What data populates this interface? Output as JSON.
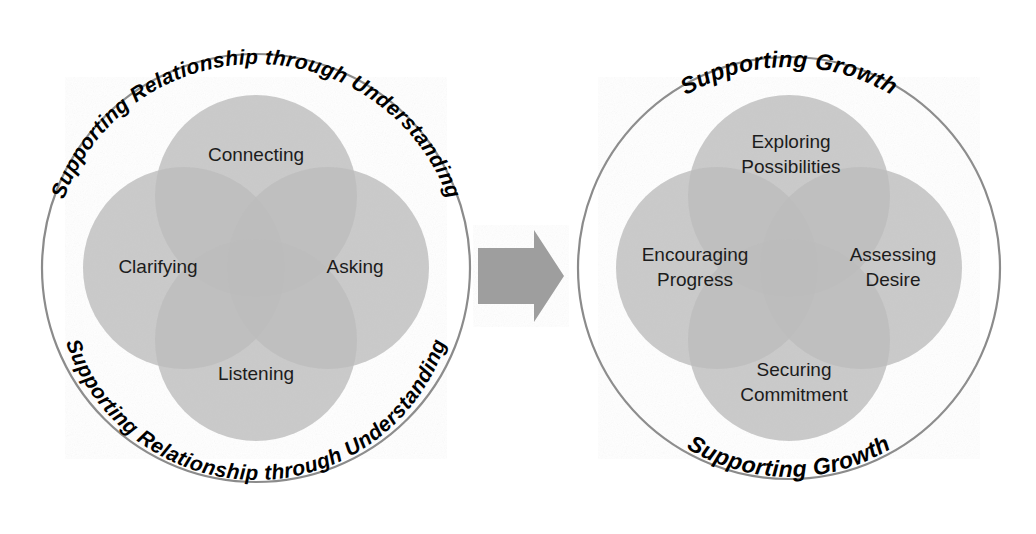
{
  "figure": {
    "background_color": "#ffffff",
    "outline_color": "#7a7a7a",
    "petal_fill": "#c3c3c3",
    "petal_overlap_fill": "#b0b0b0",
    "arrow_fill": "#9e9e9e",
    "label_color": "#1c1c1c",
    "arc_label_color": "#000000"
  },
  "left_circle": {
    "name": "supporting-relationship-circle",
    "arc_top_label": "Supporting Relationship through Understanding",
    "arc_bottom_label": "Supporting Relationship through Understanding",
    "center": {
      "x": 256,
      "y": 268
    },
    "radius": 214,
    "petals": [
      {
        "position": "top",
        "label": "Connecting",
        "lines": [
          "Connecting"
        ],
        "cx": 256,
        "cy": 196,
        "r": 101
      },
      {
        "position": "left",
        "label": "Clarifying",
        "lines": [
          "Clarifying"
        ],
        "cx": 184,
        "cy": 268,
        "r": 101
      },
      {
        "position": "right",
        "label": "Asking",
        "lines": [
          "Asking"
        ],
        "cx": 328,
        "cy": 268,
        "r": 101
      },
      {
        "position": "bottom",
        "label": "Listening",
        "lines": [
          "Listening"
        ],
        "cx": 256,
        "cy": 340,
        "r": 101
      }
    ],
    "label_positions": [
      {
        "x": 256,
        "y": 156
      },
      {
        "x": 158,
        "y": 268
      },
      {
        "x": 355,
        "y": 268
      },
      {
        "x": 256,
        "y": 375
      }
    ]
  },
  "right_circle": {
    "name": "supporting-growth-circle",
    "arc_top_label": "Supporting Growth",
    "arc_bottom_label": "Supporting Growth",
    "center": {
      "x": 789,
      "y": 268
    },
    "radius": 211,
    "petals": [
      {
        "position": "top",
        "label": "Exploring Possibilities",
        "lines": [
          "Exploring",
          "Possibilities"
        ],
        "cx": 789,
        "cy": 196,
        "r": 101
      },
      {
        "position": "left",
        "label": "Encouraging Progress",
        "lines": [
          "Encouraging",
          "Progress"
        ],
        "cx": 717,
        "cy": 268,
        "r": 101
      },
      {
        "position": "right",
        "label": "Assessing Desire",
        "lines": [
          "Assessing",
          "Desire"
        ],
        "cx": 861,
        "cy": 268,
        "r": 101
      },
      {
        "position": "bottom",
        "label": "Securing Commitment",
        "lines": [
          "Securing",
          "Commitment"
        ],
        "cx": 789,
        "cy": 340,
        "r": 101
      }
    ],
    "label_positions": [
      {
        "x": 791,
        "y": 143
      },
      {
        "x": 695,
        "y": 256
      },
      {
        "x": 893,
        "y": 256
      },
      {
        "x": 794,
        "y": 371
      }
    ]
  },
  "arrow": {
    "name": "transition-arrow",
    "direction": "right",
    "label": "",
    "x": 478,
    "y": 230,
    "width": 86,
    "height": 92
  },
  "text_sizes": {
    "petal_label_px": 19,
    "arc_label_left_px": 21,
    "arc_label_right_px": 23,
    "line_height_px": 25
  }
}
